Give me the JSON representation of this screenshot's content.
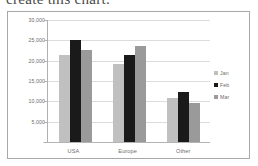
{
  "caption": {
    "text": "create this chart."
  },
  "chart_data": {
    "type": "bar",
    "title": "",
    "xlabel": "",
    "ylabel": "",
    "categories": [
      "USA",
      "Europe",
      "Other"
    ],
    "series": [
      {
        "name": "Jan",
        "color": "#c0c0c0",
        "values": [
          21500,
          19100,
          10800
        ]
      },
      {
        "name": "Feb",
        "color": "#1a1a1a",
        "values": [
          25200,
          21400,
          12400
        ]
      },
      {
        "name": "Mar",
        "color": "#9a9a9a",
        "values": [
          22700,
          23600,
          9700
        ]
      }
    ],
    "ylim": [
      0,
      30000
    ],
    "yticks": [
      0,
      5000,
      10000,
      15000,
      20000,
      25000,
      30000
    ],
    "ytick_labels": [
      "-",
      "5,000",
      "10,000",
      "15,000",
      "20,000",
      "25,000",
      "30,000"
    ],
    "grid": true,
    "legend_position": "right"
  },
  "colors": {
    "frame_border": "#a8a8a8",
    "gridline": "#dcdcdc",
    "axis": "#b0b0b0",
    "tick_text": "#6c6c6c",
    "plot_background": "#ffffff"
  }
}
